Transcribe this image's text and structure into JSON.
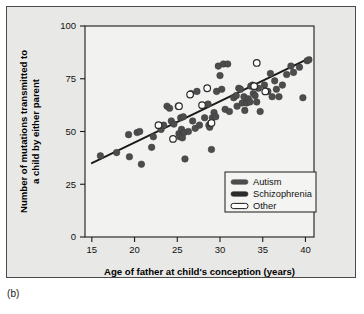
{
  "figure": {
    "caption": "(b)",
    "panel_bg": "#e8e8e6",
    "marker_color": "#4d4d4d",
    "line_color": "#1a1a1a"
  },
  "chart_data": {
    "type": "scatter",
    "title": "",
    "xlabel": "Age of father at child's conception (years)",
    "ylabel": "Number of mutations transmitted to a child by either parent",
    "ylabel_lines": [
      "Number of mutations transmitted to",
      "a child by either parent"
    ],
    "xlim": [
      14.2,
      41.0
    ],
    "ylim": [
      0,
      100
    ],
    "xticks": [
      15,
      20,
      25,
      30,
      35,
      40
    ],
    "yticks": [
      0,
      25,
      50,
      75,
      100
    ],
    "grid": false,
    "legend": {
      "position": "lower-right",
      "entries": [
        {
          "label": "Autism",
          "marker": "filled-bar",
          "color": "#4d4d4d"
        },
        {
          "label": "Schizophrenia",
          "marker": "filled-bar",
          "color": "#2b2b2b"
        },
        {
          "label": "Other",
          "marker": "hollow-bar",
          "color": "#ffffff"
        }
      ]
    },
    "trendline": {
      "x": [
        15.0,
        40.6
      ],
      "y": [
        35.0,
        85.0
      ],
      "color": "#1a1a1a"
    },
    "series": [
      {
        "name": "Autism / Schizophrenia",
        "marker": "filled-circle",
        "color": "#4d4d4d",
        "points": [
          [
            16.0,
            38.5
          ],
          [
            17.9,
            40.0
          ],
          [
            19.3,
            48.5
          ],
          [
            19.4,
            38.0
          ],
          [
            20.3,
            49.5
          ],
          [
            20.6,
            50.0
          ],
          [
            20.8,
            34.5
          ],
          [
            22.0,
            42.5
          ],
          [
            22.2,
            47.5
          ],
          [
            23.1,
            51.0
          ],
          [
            23.4,
            53.0
          ],
          [
            23.8,
            62.0
          ],
          [
            24.1,
            61.0
          ],
          [
            24.3,
            55.0
          ],
          [
            24.6,
            53.5
          ],
          [
            25.1,
            62.0
          ],
          [
            25.2,
            49.0
          ],
          [
            25.3,
            47.5
          ],
          [
            25.4,
            56.5
          ],
          [
            25.5,
            51.0
          ],
          [
            25.6,
            47.0
          ],
          [
            25.7,
            57.0
          ],
          [
            25.8,
            49.5
          ],
          [
            25.9,
            37.0
          ],
          [
            26.3,
            50.0
          ],
          [
            26.6,
            68.0
          ],
          [
            26.8,
            55.0
          ],
          [
            27.1,
            51.5
          ],
          [
            27.3,
            69.0
          ],
          [
            27.6,
            53.0
          ],
          [
            28.2,
            56.5
          ],
          [
            28.6,
            63.0
          ],
          [
            28.7,
            53.0
          ],
          [
            28.8,
            52.0
          ],
          [
            28.9,
            54.0
          ],
          [
            29.0,
            41.5
          ],
          [
            29.1,
            56.5
          ],
          [
            29.3,
            59.0
          ],
          [
            29.5,
            57.0
          ],
          [
            29.6,
            69.0
          ],
          [
            29.8,
            81.0
          ],
          [
            30.0,
            76.5
          ],
          [
            30.2,
            70.0
          ],
          [
            30.4,
            82.0
          ],
          [
            30.6,
            60.5
          ],
          [
            30.9,
            82.0
          ],
          [
            31.1,
            59.5
          ],
          [
            31.6,
            66.0
          ],
          [
            31.9,
            67.0
          ],
          [
            32.0,
            62.0
          ],
          [
            32.2,
            70.5
          ],
          [
            32.4,
            70.0
          ],
          [
            32.6,
            63.5
          ],
          [
            32.8,
            66.5
          ],
          [
            32.9,
            60.0
          ],
          [
            33.1,
            63.5
          ],
          [
            33.3,
            65.5
          ],
          [
            33.5,
            64.0
          ],
          [
            33.6,
            71.5
          ],
          [
            33.8,
            72.0
          ],
          [
            33.9,
            68.0
          ],
          [
            34.1,
            67.0
          ],
          [
            34.3,
            64.0
          ],
          [
            34.5,
            70.5
          ],
          [
            34.7,
            59.5
          ],
          [
            35.2,
            72.0
          ],
          [
            35.6,
            69.0
          ],
          [
            35.9,
            77.5
          ],
          [
            36.1,
            66.5
          ],
          [
            36.4,
            74.0
          ],
          [
            36.6,
            70.0
          ],
          [
            36.9,
            66.5
          ],
          [
            37.3,
            72.0
          ],
          [
            37.8,
            77.0
          ],
          [
            38.3,
            81.0
          ],
          [
            38.6,
            78.0
          ],
          [
            39.3,
            80.5
          ],
          [
            39.7,
            66.0
          ],
          [
            40.2,
            83.5
          ],
          [
            40.4,
            84.0
          ]
        ]
      },
      {
        "name": "Other",
        "marker": "hollow-circle",
        "color": "#ffffff",
        "points": [
          [
            22.8,
            53.0
          ],
          [
            24.5,
            46.5
          ],
          [
            25.2,
            62.0
          ],
          [
            26.5,
            67.5
          ],
          [
            27.9,
            62.5
          ],
          [
            28.5,
            70.5
          ],
          [
            29.0,
            54.0
          ],
          [
            34.3,
            82.5
          ],
          [
            34.0,
            71.5
          ],
          [
            35.3,
            69.0
          ]
        ]
      }
    ]
  }
}
